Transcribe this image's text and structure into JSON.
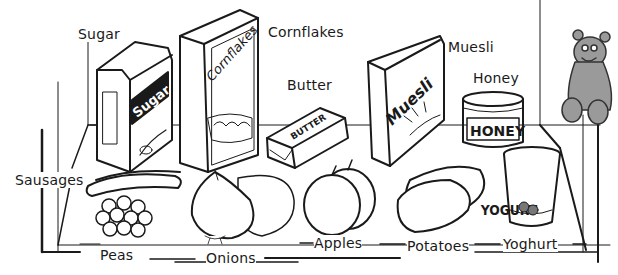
{
  "illustration": {
    "subject": "fridge-food-vocabulary",
    "labels": [
      {
        "id": "sugar",
        "text": "Sugar",
        "x": 78,
        "y": 26
      },
      {
        "id": "cornflakes",
        "text": "Cornflakes",
        "x": 268,
        "y": 24
      },
      {
        "id": "butter",
        "text": "Butter",
        "x": 287,
        "y": 77
      },
      {
        "id": "muesli",
        "text": "Muesli",
        "x": 448,
        "y": 39
      },
      {
        "id": "honey",
        "text": "Honey",
        "x": 473,
        "y": 70
      },
      {
        "id": "sausages",
        "text": "Sausages",
        "x": 15,
        "y": 172
      },
      {
        "id": "peas",
        "text": "Peas",
        "x": 100,
        "y": 247
      },
      {
        "id": "onions",
        "text": "Onions",
        "x": 206,
        "y": 250
      },
      {
        "id": "apples",
        "text": "Apples",
        "x": 314,
        "y": 235
      },
      {
        "id": "potatoes",
        "text": "Potatoes",
        "x": 407,
        "y": 238
      },
      {
        "id": "yoghurt",
        "text": "Yoghurt",
        "x": 503,
        "y": 236
      }
    ],
    "package_texts": {
      "sugar": "Sugar",
      "cornflakes": "Cornflakes",
      "butter": "BUTTER",
      "muesli": "Muesli",
      "honey": "HONEY",
      "yogurt": "YOGURT"
    },
    "colors": {
      "ink": "#1a1a1a",
      "background": "#ffffff",
      "bear_fill": "#9a9a9a"
    }
  }
}
